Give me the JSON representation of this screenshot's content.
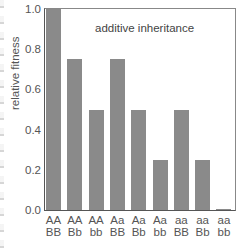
{
  "chart_data": {
    "type": "bar",
    "title": "additive inheritance",
    "xlabel": "",
    "ylabel": "relative fitness",
    "ylim": [
      0.0,
      1.0
    ],
    "yticks": [
      "0.0",
      "0.2",
      "0.4",
      "0.6",
      "0.8",
      "1.0"
    ],
    "categories": [
      "AA BB",
      "AA Bb",
      "AA bb",
      "Aa BB",
      "Aa Bb",
      "Aa bb",
      "aa BB",
      "aa Bb",
      "aa bb"
    ],
    "category_lines": [
      [
        "AA",
        "BB"
      ],
      [
        "AA",
        "Bb"
      ],
      [
        "AA",
        "bb"
      ],
      [
        "Aa",
        "BB"
      ],
      [
        "Aa",
        "Bb"
      ],
      [
        "Aa",
        "bb"
      ],
      [
        "aa",
        "BB"
      ],
      [
        "aa",
        "Bb"
      ],
      [
        "aa",
        "bb"
      ]
    ],
    "values": [
      1.0,
      0.75,
      0.5,
      0.75,
      0.5,
      0.25,
      0.5,
      0.25,
      0.0
    ],
    "bar_color": "#8a8a8a",
    "grid": false,
    "legend": null
  }
}
